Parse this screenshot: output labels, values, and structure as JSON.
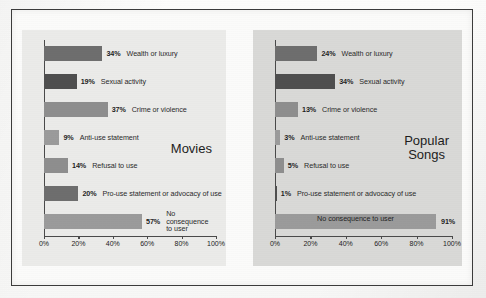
{
  "chart_data": [
    {
      "type": "bar",
      "orientation": "horizontal",
      "title": "Movies",
      "xlabel": "",
      "ylabel": "",
      "xlim": [
        0,
        100
      ],
      "xticks": [
        "0%",
        "20%",
        "40%",
        "60%",
        "80%",
        "100%"
      ],
      "xtick_values": [
        0,
        20,
        40,
        60,
        80,
        100
      ],
      "grid": false,
      "legend": "none",
      "categories": [
        "Wealth or luxury",
        "Sexual activity",
        "Crime or violence",
        "Anti-use statement",
        "Refusal to use",
        "Pro-use statement or advocacy of use",
        "No consequence to user"
      ],
      "values": [
        34,
        19,
        37,
        9,
        14,
        20,
        57
      ],
      "value_labels": [
        "34%",
        "19%",
        "37%",
        "9%",
        "14%",
        "20%",
        "57%"
      ]
    },
    {
      "type": "bar",
      "orientation": "horizontal",
      "title": "Popular Songs",
      "xlabel": "",
      "ylabel": "",
      "xlim": [
        0,
        100
      ],
      "xticks": [
        "0%",
        "20%",
        "40%",
        "60%",
        "80%",
        "100%"
      ],
      "xtick_values": [
        0,
        20,
        40,
        60,
        80,
        100
      ],
      "grid": false,
      "legend": "none",
      "categories": [
        "Wealth or luxury",
        "Sexual activity",
        "Crime or violence",
        "Anti-use statement",
        "Refusal to use",
        "Pro-use statement or advocacy of use",
        "No consequence to user"
      ],
      "values": [
        24,
        34,
        13,
        3,
        5,
        1,
        91
      ],
      "value_labels": [
        "24%",
        "34%",
        "13%",
        "3%",
        "5%",
        "1%",
        "91%"
      ]
    }
  ],
  "charts": [
    {
      "name": "movies",
      "title_line1": "Movies",
      "title_line2": "",
      "panel_color": "#ebebe9",
      "rows": [
        {
          "value": 34,
          "label": "34%",
          "category": "Wealth or luxury",
          "shade": "dark",
          "label_inside": false,
          "wrap": false
        },
        {
          "value": 19,
          "label": "19%",
          "category": "Sexual activity",
          "shade": "darker",
          "label_inside": false,
          "wrap": false
        },
        {
          "value": 37,
          "label": "37%",
          "category": "Crime or violence",
          "shade": "mid",
          "label_inside": false,
          "wrap": false
        },
        {
          "value": 9,
          "label": "9%",
          "category": "Anti-use statement",
          "shade": "light",
          "label_inside": false,
          "wrap": false
        },
        {
          "value": 14,
          "label": "14%",
          "category": "Refusal to use",
          "shade": "mid",
          "label_inside": false,
          "wrap": false
        },
        {
          "value": 20,
          "label": "20%",
          "category": "Pro-use statement or advocacy of use",
          "shade": "dark",
          "label_inside": false,
          "wrap": false
        },
        {
          "value": 57,
          "label": "57%",
          "category": "No consequence to user",
          "shade": "light",
          "label_inside": false,
          "wrap": true
        }
      ],
      "xticks": [
        "0%",
        "20%",
        "40%",
        "60%",
        "80%",
        "100%"
      ]
    },
    {
      "name": "songs",
      "title_line1": "Popular",
      "title_line2": "Songs",
      "panel_color": "#d9d9d7",
      "rows": [
        {
          "value": 24,
          "label": "24%",
          "category": "Wealth or luxury",
          "shade": "dark",
          "label_inside": false,
          "wrap": false
        },
        {
          "value": 34,
          "label": "34%",
          "category": "Sexual activity",
          "shade": "darker",
          "label_inside": false,
          "wrap": false
        },
        {
          "value": 13,
          "label": "13%",
          "category": "Crime or violence",
          "shade": "mid",
          "label_inside": false,
          "wrap": false
        },
        {
          "value": 3,
          "label": "3%",
          "category": "Anti-use statement",
          "shade": "light",
          "label_inside": false,
          "wrap": false
        },
        {
          "value": 5,
          "label": "5%",
          "category": "Refusal to use",
          "shade": "mid",
          "label_inside": false,
          "wrap": false
        },
        {
          "value": 1,
          "label": "1%",
          "category": "Pro-use statement or advocacy of use",
          "shade": "darker",
          "label_inside": false,
          "wrap": false
        },
        {
          "value": 91,
          "label": "91%",
          "category": "No consequence to user",
          "shade": "light",
          "label_inside": true,
          "wrap": false
        }
      ],
      "xticks": [
        "0%",
        "20%",
        "40%",
        "60%",
        "80%",
        "100%"
      ]
    }
  ]
}
